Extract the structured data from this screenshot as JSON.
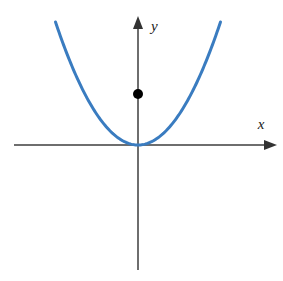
{
  "figure": {
    "width": 283,
    "height": 281,
    "background_color": "#ffffff"
  },
  "axes": {
    "x_axis": {
      "label": "x",
      "label_x": 261,
      "label_y": 129,
      "line_start_x": 14,
      "line_end_x": 277,
      "line_y": 145,
      "color": "#6e6e6e",
      "width": 1.6,
      "arrow": "right"
    },
    "y_axis": {
      "label": "y",
      "label_x": 151,
      "label_y": 31,
      "line_x": 138,
      "line_start_y": 16,
      "line_end_y": 270,
      "color": "#6e6e6e",
      "width": 1.6,
      "arrow": "up"
    },
    "origin": {
      "x": 138,
      "y": 145
    }
  },
  "chart_data": {
    "type": "line",
    "title": "",
    "xlabel": "x",
    "ylabel": "y",
    "grid": false,
    "legend": null,
    "xlim": [
      -8.1,
      9.2
    ],
    "ylim": [
      -4.1,
      2.0
    ],
    "series": [
      {
        "name": "parabola",
        "equation": "y = x^2",
        "color": "#3a7cc0",
        "line_width": 3,
        "vertex": {
          "x": 0,
          "y": 0
        },
        "x": [
          -4.45,
          -4.0,
          -3.5,
          -3.0,
          -2.5,
          -2.0,
          -1.5,
          -1.0,
          -0.5,
          0.0,
          0.5,
          1.0,
          1.5,
          2.0,
          2.5,
          3.0,
          3.5,
          4.0,
          4.45
        ],
        "y": [
          19.8,
          16.0,
          12.25,
          9.0,
          6.25,
          4.0,
          2.25,
          1.0,
          0.25,
          0.0,
          0.25,
          1.0,
          2.25,
          4.0,
          6.25,
          9.0,
          12.25,
          16.0,
          19.8
        ]
      }
    ],
    "points": [
      {
        "name": "y-axis-point",
        "x": 0,
        "y": 2.0,
        "color": "#000000",
        "radius": 5,
        "label": ""
      }
    ],
    "annotations": []
  },
  "curve_pixels": {
    "path": "M 55.5 22 C 77 64, 100 112, 117 135 C 128 149, 148 149, 159 135 C 176 112, 199 64, 220.5 22",
    "color": "#3a7cc0",
    "stroke_width": 3
  },
  "point_pixels": {
    "cx": 138,
    "cy": 94,
    "r": 5,
    "color": "#000000"
  }
}
